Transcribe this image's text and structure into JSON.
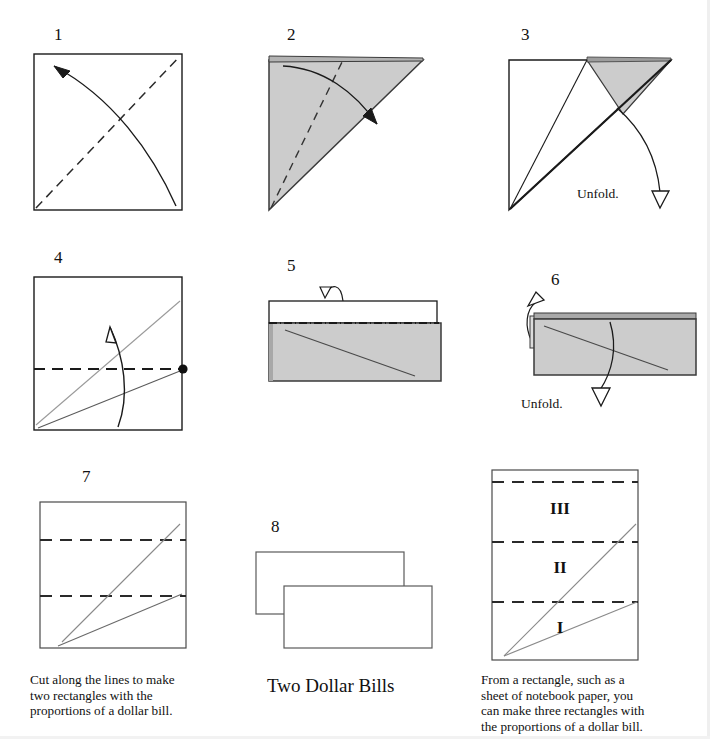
{
  "page": {
    "width": 710,
    "height": 739,
    "background": "#ffffff",
    "partial_top_text": "..."
  },
  "colors": {
    "ink": "#111111",
    "shade": "#cccccc",
    "shade_dark": "#b9b9b9",
    "crease_gray": "#8a8a8a",
    "paper": "#ffffff"
  },
  "steps": [
    {
      "id": "step-1",
      "number": "1",
      "description": "Square sheet with dashed diagonal crease from bottom-left to top-right and a curved valley-fold arrow sweeping from bottom-right to top-left."
    },
    {
      "id": "step-2",
      "number": "2",
      "description": "Shaded triangle (folded in half diagonally). Dashed crease from the bottom-left point to the top edge, curved arrow folding the top-left corner down to the right."
    },
    {
      "id": "step-3",
      "number": "3",
      "description": "Small shaded flap folded over at the top right. Hollow unfold arrow pointing down and to the right.",
      "note": "Unfold."
    },
    {
      "id": "step-4",
      "number": "4",
      "description": "Unfolded square showing two gray crease lines radiating from the bottom-left corner, a horizontal dashed fold line across the middle and a reference dot on the right edge. Curved arrow folds the bottom edge up.",
      "has_reference_dot": true
    },
    {
      "id": "step-5",
      "number": "5",
      "description": "Folded in half horizontally: shaded lower band with a diagonal crease, a white strip above, dash-dot fold line between, small hollow arrow folding the top strip down."
    },
    {
      "id": "step-6",
      "number": "6",
      "description": "Result of the fold, shaded rectangle with diagonal crease. Hollow arrows point up-left and down to unfold.",
      "note": "Unfold."
    },
    {
      "id": "step-7",
      "number": "7",
      "description": "Square showing two horizontal dashed cut lines and two gray diagonals from the bottom-left corner."
    },
    {
      "id": "step-8",
      "number": "8",
      "description": "Two overlapping rectangles with the proportions of a dollar bill."
    }
  ],
  "captions": {
    "left": "Cut along the lines to make\ntwo rectangles with the\nproportions of a dollar bill.",
    "center": "Two Dollar Bills",
    "right": "From a rectangle, such as a\nsheet of notebook paper, you\ncan make three rectangles with\nthe proportions of a dollar bill."
  },
  "labels": {
    "unfold": "Unfold."
  },
  "right_figure": {
    "id": "notebook-rectangle",
    "regions": [
      {
        "label": "III",
        "position": "top"
      },
      {
        "label": "II",
        "position": "middle"
      },
      {
        "label": "I",
        "position": "bottom"
      }
    ],
    "dashed_line_count": 3,
    "diagonal_count": 2
  }
}
